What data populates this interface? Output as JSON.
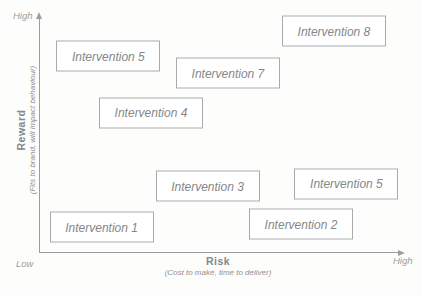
{
  "figure": {
    "y_axis": {
      "title": "Reward",
      "subtitle": "(Fits to brand, will impact behaviour)",
      "high_label": "High"
    },
    "x_axis": {
      "title": "Risk",
      "subtitle": "(Cost to make, time to deliver)",
      "high_label": "High"
    },
    "origin_label": "Low",
    "colors": {
      "text": "#84878a",
      "box_border": "#a8abad",
      "axis": "#9b9ea0",
      "background": "#fdfdfc"
    }
  },
  "chart_data": {
    "type": "scatter",
    "title": "",
    "xlabel": "Risk (Cost to make, time to deliver)",
    "ylabel": "Reward (Fits to brand, will impact behaviour)",
    "x_range_labels": [
      "Low",
      "High"
    ],
    "y_range_labels": [
      "Low",
      "High"
    ],
    "axis_units": "estimated percent position from Low (0) to High (100)",
    "grid": false,
    "legend": null,
    "points": [
      {
        "label": "Intervention 5",
        "x": 19.1,
        "y": 84.1
      },
      {
        "label": "Intervention 8",
        "x": 82.1,
        "y": 94.8
      },
      {
        "label": "Intervention 7",
        "x": 52.5,
        "y": 76.8
      },
      {
        "label": "Intervention 4",
        "x": 31.0,
        "y": 59.7
      },
      {
        "label": "Intervention 3",
        "x": 46.8,
        "y": 28.3
      },
      {
        "label": "Intervention 5",
        "x": 85.6,
        "y": 29.2
      },
      {
        "label": "Intervention 2",
        "x": 72.9,
        "y": 12.0
      },
      {
        "label": "Intervention 1",
        "x": 17.2,
        "y": 10.7
      }
    ]
  }
}
